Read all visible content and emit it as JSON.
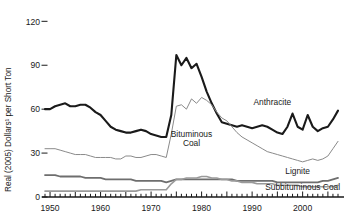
{
  "chart_data": {
    "type": "line",
    "title": "",
    "xlabel": "",
    "ylabel": "Real (2005) Dollars¹ per Short Ton",
    "xlim": [
      1949,
      2007
    ],
    "ylim": [
      0,
      125
    ],
    "grid": false,
    "legend_position": "inline-annotations",
    "ytick_labels": [
      "0",
      "30",
      "60",
      "90",
      "120"
    ],
    "ytick_values": [
      0,
      30,
      60,
      90,
      120
    ],
    "xtick_labels": [
      "1950",
      "1960",
      "1970",
      "1980",
      "1990",
      "2000"
    ],
    "xtick_values": [
      1950,
      1960,
      1970,
      1980,
      1990,
      2000
    ],
    "x": [
      1949,
      1950,
      1951,
      1952,
      1953,
      1954,
      1955,
      1956,
      1957,
      1958,
      1959,
      1960,
      1961,
      1962,
      1963,
      1964,
      1965,
      1966,
      1967,
      1968,
      1969,
      1970,
      1971,
      1972,
      1973,
      1974,
      1975,
      1976,
      1977,
      1978,
      1979,
      1980,
      1981,
      1982,
      1983,
      1984,
      1985,
      1986,
      1987,
      1988,
      1989,
      1990,
      1991,
      1992,
      1993,
      1994,
      1995,
      1996,
      1997,
      1998,
      1999,
      2000,
      2001,
      2002,
      2003,
      2004,
      2005,
      2006,
      2007
    ],
    "series": [
      {
        "name": "Anthracite",
        "color": "#1a1a1a",
        "width": 2.1,
        "label_x": 1994,
        "label_y": 63,
        "values": [
          60,
          60,
          62,
          63,
          64,
          62,
          62,
          63,
          63,
          61,
          58,
          56,
          52,
          48,
          46,
          45,
          44,
          44,
          45,
          46,
          45,
          43,
          42,
          41,
          41,
          56,
          97,
          90,
          95,
          88,
          91,
          82,
          72,
          64,
          57,
          51,
          50,
          49,
          48,
          49,
          48,
          47,
          48,
          49,
          48,
          46,
          44,
          43,
          48,
          57,
          48,
          46,
          56,
          48,
          45,
          47,
          48,
          53,
          59
        ]
      },
      {
        "name": "Bituminous Coal",
        "color": "#8a8a8a",
        "width": 1.0,
        "label_x": 1978,
        "label_y": 41,
        "values": [
          33,
          33,
          33,
          32,
          31,
          30,
          29,
          29,
          29,
          28,
          27,
          27,
          27,
          27,
          26,
          26,
          28,
          28,
          27,
          27,
          28,
          29,
          29,
          28,
          27,
          43,
          62,
          63,
          60,
          67,
          64,
          68,
          66,
          63,
          58,
          54,
          52,
          48,
          44,
          41,
          39,
          37,
          35,
          33,
          31,
          30,
          29,
          28,
          27,
          26,
          25,
          24,
          25,
          26,
          25,
          26,
          28,
          33,
          38
        ]
      },
      {
        "name": "Lignite",
        "color": "#6e6e6e",
        "width": 1.8,
        "label_x": 1999,
        "label_y": 16,
        "values": [
          15,
          15,
          15,
          14,
          14,
          14,
          14,
          14,
          13,
          13,
          13,
          13,
          12,
          12,
          12,
          12,
          12,
          12,
          11,
          11,
          11,
          11,
          11,
          11,
          10,
          11,
          12,
          12,
          12,
          12,
          12,
          12,
          12,
          12,
          12,
          12,
          12,
          12,
          11,
          11,
          11,
          11,
          11,
          11,
          11,
          11,
          10,
          10,
          10,
          10,
          10,
          10,
          10,
          10,
          10,
          11,
          11,
          12,
          13
        ]
      },
      {
        "name": "Subbituminous Coal",
        "color": "#9a9a9a",
        "width": 1.6,
        "label_x": 2000,
        "label_y": 5,
        "values": [
          4,
          4,
          4,
          4,
          4,
          4,
          4,
          4,
          4,
          4,
          4,
          4,
          4,
          4,
          4,
          4,
          4,
          4,
          4,
          5,
          5,
          5,
          5,
          5,
          5,
          9,
          12,
          12,
          13,
          13,
          13,
          14,
          14,
          13,
          13,
          12,
          12,
          11,
          11,
          10,
          10,
          10,
          9,
          9,
          9,
          9,
          8,
          8,
          8,
          8,
          8,
          7,
          7,
          7,
          7,
          7,
          7,
          7,
          8
        ]
      }
    ]
  }
}
